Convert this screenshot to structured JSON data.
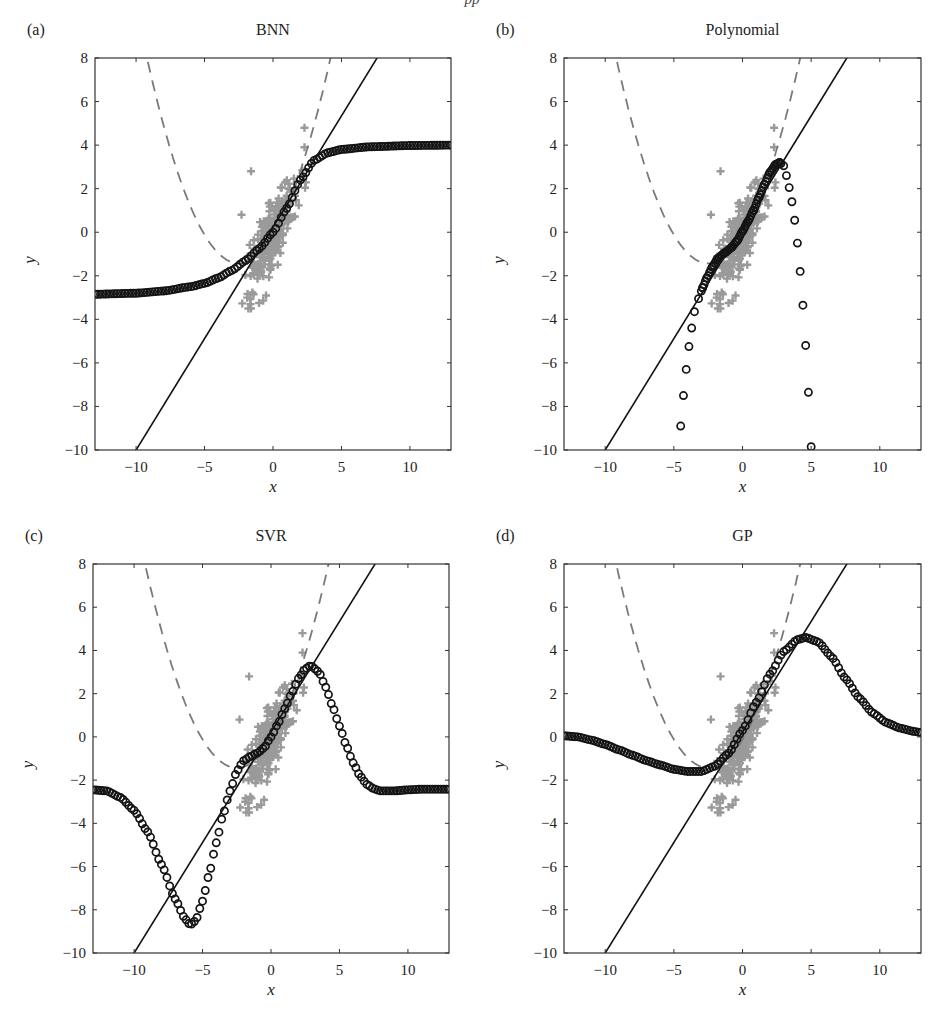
{
  "figure": {
    "caption_fragment": "pp",
    "panels": [
      {
        "id": "a",
        "label": "(a)",
        "title": "BNN"
      },
      {
        "id": "b",
        "label": "(b)",
        "title": "Polynomial"
      },
      {
        "id": "c",
        "label": "(c)",
        "title": "SVR"
      },
      {
        "id": "d",
        "label": "(d)",
        "title": "GP"
      }
    ],
    "colors": {
      "scatter": "#9a9a9a",
      "dashed": "#7a7a7a",
      "line": "#111111",
      "circles": "#141414",
      "axes": "#333333"
    }
  },
  "chart_data": [
    {
      "type": "scatter",
      "panel": "(a)",
      "title": "BNN",
      "xlabel": "x",
      "ylabel": "y",
      "xlim": [
        -13,
        13
      ],
      "ylim": [
        -10,
        8
      ],
      "xticks": [
        -10,
        -5,
        0,
        5,
        10
      ],
      "yticks": [
        -10,
        -8,
        -6,
        -4,
        -2,
        0,
        2,
        4,
        6,
        8
      ],
      "grid": false,
      "series": [
        {
          "name": "training data",
          "style": "gray plus markers",
          "x_range": [
            -2.5,
            2.5
          ],
          "y_range": [
            -3.5,
            4.8
          ]
        },
        {
          "name": "true function",
          "style": "solid black line",
          "points": [
            [
              -10,
              -10
            ],
            [
              7.6,
              8
            ]
          ]
        },
        {
          "name": "dashed parabola",
          "style": "gray dashed",
          "vertex": [
            -2.5,
            -1.43
          ],
          "a": 0.21
        },
        {
          "name": "BNN prediction",
          "style": "black circles",
          "points": [
            [
              -13,
              -2.85
            ],
            [
              -10,
              -2.8
            ],
            [
              -8,
              -2.7
            ],
            [
              -6,
              -2.5
            ],
            [
              -5,
              -2.35
            ],
            [
              -4,
              -2.1
            ],
            [
              -3,
              -1.75
            ],
            [
              -2,
              -1.3
            ],
            [
              -1,
              -0.75
            ],
            [
              0,
              0
            ],
            [
              1,
              1.1
            ],
            [
              2,
              2.4
            ],
            [
              3,
              3.3
            ],
            [
              4,
              3.65
            ],
            [
              5,
              3.8
            ],
            [
              7,
              3.92
            ],
            [
              10,
              3.98
            ],
            [
              13,
              4.0
            ]
          ]
        }
      ]
    },
    {
      "type": "scatter",
      "panel": "(b)",
      "title": "Polynomial",
      "xlabel": "x",
      "ylabel": "y",
      "xlim": [
        -13,
        13
      ],
      "ylim": [
        -10,
        8
      ],
      "xticks": [
        -10,
        -5,
        0,
        5,
        10
      ],
      "yticks": [
        -10,
        -8,
        -6,
        -4,
        -2,
        0,
        2,
        4,
        6,
        8
      ],
      "grid": false,
      "series": [
        {
          "name": "training data",
          "style": "gray plus markers",
          "x_range": [
            -2.5,
            2.5
          ],
          "y_range": [
            -3.5,
            4.8
          ]
        },
        {
          "name": "true function",
          "style": "solid black line",
          "points": [
            [
              -10,
              -10
            ],
            [
              7.6,
              8
            ]
          ]
        },
        {
          "name": "dashed parabola",
          "style": "gray dashed",
          "vertex": [
            -2.5,
            -1.43
          ],
          "a": 0.21
        },
        {
          "name": "Polynomial prediction",
          "style": "black circles",
          "points": [
            [
              -4.5,
              -8.9
            ],
            [
              -4.3,
              -7.5
            ],
            [
              -4.1,
              -6.3
            ],
            [
              -3.9,
              -5.25
            ],
            [
              -3.7,
              -4.4
            ],
            [
              -3.5,
              -3.65
            ],
            [
              -3.2,
              -3.05
            ],
            [
              -2.9,
              -2.55
            ],
            [
              -2.6,
              -2.1
            ],
            [
              -2.2,
              -1.6
            ],
            [
              -1.8,
              -1.2
            ],
            [
              -1.3,
              -0.95
            ],
            [
              -0.8,
              -0.7
            ],
            [
              -0.4,
              -0.4
            ],
            [
              0,
              0.05
            ],
            [
              0.4,
              0.5
            ],
            [
              0.8,
              1.0
            ],
            [
              1.2,
              1.6
            ],
            [
              1.6,
              2.2
            ],
            [
              2.0,
              2.75
            ],
            [
              2.4,
              3.1
            ],
            [
              2.7,
              3.2
            ],
            [
              3.0,
              3.05
            ],
            [
              3.2,
              2.6
            ],
            [
              3.4,
              2.05
            ],
            [
              3.6,
              1.4
            ],
            [
              3.8,
              0.55
            ],
            [
              4.0,
              -0.5
            ],
            [
              4.2,
              -1.8
            ],
            [
              4.4,
              -3.35
            ],
            [
              4.6,
              -5.2
            ],
            [
              4.8,
              -7.35
            ],
            [
              5.0,
              -9.85
            ]
          ]
        }
      ]
    },
    {
      "type": "scatter",
      "panel": "(c)",
      "title": "SVR",
      "xlabel": "x",
      "ylabel": "y",
      "xlim": [
        -13,
        13
      ],
      "ylim": [
        -10,
        8
      ],
      "xticks": [
        -10,
        -5,
        0,
        5,
        10
      ],
      "yticks": [
        -10,
        -8,
        -6,
        -4,
        -2,
        0,
        2,
        4,
        6,
        8
      ],
      "grid": false,
      "series": [
        {
          "name": "training data",
          "style": "gray plus markers",
          "x_range": [
            -2.5,
            2.5
          ],
          "y_range": [
            -3.5,
            4.8
          ]
        },
        {
          "name": "true function",
          "style": "solid black line",
          "points": [
            [
              -10,
              -10
            ],
            [
              7.6,
              8
            ]
          ]
        },
        {
          "name": "dashed parabola",
          "style": "gray dashed",
          "vertex": [
            -2.5,
            -1.43
          ],
          "a": 0.21
        },
        {
          "name": "SVR prediction",
          "style": "black circles",
          "points": [
            [
              -13,
              -2.45
            ],
            [
              -12,
              -2.5
            ],
            [
              -11,
              -2.8
            ],
            [
              -10,
              -3.4
            ],
            [
              -9,
              -4.4
            ],
            [
              -8,
              -5.9
            ],
            [
              -7,
              -7.5
            ],
            [
              -6.3,
              -8.4
            ],
            [
              -5.9,
              -8.7
            ],
            [
              -5.5,
              -8.5
            ],
            [
              -5,
              -7.6
            ],
            [
              -4.5,
              -6.3
            ],
            [
              -4,
              -4.9
            ],
            [
              -3.5,
              -3.6
            ],
            [
              -3,
              -2.5
            ],
            [
              -2.5,
              -1.6
            ],
            [
              -2,
              -1.1
            ],
            [
              -1.5,
              -0.9
            ],
            [
              -1,
              -0.75
            ],
            [
              -0.5,
              -0.5
            ],
            [
              0,
              0
            ],
            [
              0.5,
              0.6
            ],
            [
              1,
              1.3
            ],
            [
              1.5,
              2.0
            ],
            [
              2,
              2.7
            ],
            [
              2.5,
              3.15
            ],
            [
              2.9,
              3.3
            ],
            [
              3.5,
              3.0
            ],
            [
              4,
              2.3
            ],
            [
              4.5,
              1.4
            ],
            [
              5,
              0.5
            ],
            [
              5.5,
              -0.4
            ],
            [
              6,
              -1.2
            ],
            [
              6.5,
              -1.8
            ],
            [
              7,
              -2.2
            ],
            [
              7.5,
              -2.4
            ],
            [
              8,
              -2.5
            ],
            [
              9,
              -2.5
            ],
            [
              10,
              -2.45
            ],
            [
              11,
              -2.42
            ],
            [
              12,
              -2.42
            ],
            [
              13,
              -2.42
            ]
          ]
        }
      ]
    },
    {
      "type": "scatter",
      "panel": "(d)",
      "title": "GP",
      "xlabel": "x",
      "ylabel": "y",
      "xlim": [
        -13,
        13
      ],
      "ylim": [
        -10,
        8
      ],
      "xticks": [
        -10,
        -5,
        0,
        5,
        10
      ],
      "yticks": [
        -10,
        -8,
        -6,
        -4,
        -2,
        0,
        2,
        4,
        6,
        8
      ],
      "grid": false,
      "series": [
        {
          "name": "training data",
          "style": "gray plus markers",
          "x_range": [
            -2.5,
            2.5
          ],
          "y_range": [
            -3.5,
            4.8
          ]
        },
        {
          "name": "true function",
          "style": "solid black line",
          "points": [
            [
              -10,
              -10
            ],
            [
              7.6,
              8
            ]
          ]
        },
        {
          "name": "dashed parabola",
          "style": "gray dashed",
          "vertex": [
            -2.5,
            -1.43
          ],
          "a": 0.21
        },
        {
          "name": "GP prediction",
          "style": "black circles",
          "points": [
            [
              -13,
              0.05
            ],
            [
              -12,
              0.0
            ],
            [
              -11,
              -0.15
            ],
            [
              -10,
              -0.35
            ],
            [
              -9,
              -0.6
            ],
            [
              -8,
              -0.85
            ],
            [
              -7,
              -1.1
            ],
            [
              -6,
              -1.3
            ],
            [
              -5,
              -1.5
            ],
            [
              -4,
              -1.6
            ],
            [
              -3,
              -1.6
            ],
            [
              -2,
              -1.35
            ],
            [
              -1,
              -0.75
            ],
            [
              0,
              0.3
            ],
            [
              1,
              1.6
            ],
            [
              2,
              2.9
            ],
            [
              3,
              3.95
            ],
            [
              4,
              4.5
            ],
            [
              4.6,
              4.6
            ],
            [
              5.5,
              4.4
            ],
            [
              6.5,
              3.7
            ],
            [
              7.5,
              2.7
            ],
            [
              8.5,
              1.8
            ],
            [
              9.5,
              1.1
            ],
            [
              10.5,
              0.65
            ],
            [
              11.5,
              0.4
            ],
            [
              12.5,
              0.25
            ],
            [
              13,
              0.2
            ]
          ]
        }
      ]
    }
  ]
}
